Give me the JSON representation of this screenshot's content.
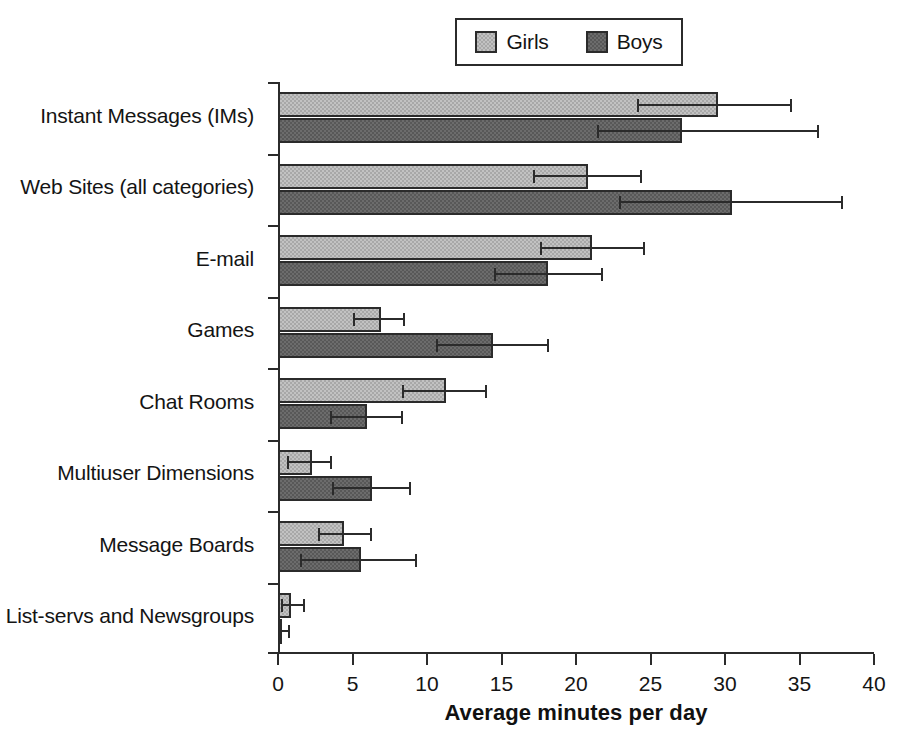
{
  "chart_data": {
    "type": "bar",
    "orientation": "horizontal",
    "title": "",
    "xlabel": "Average minutes per day",
    "ylabel": "",
    "xlim": [
      0,
      40
    ],
    "xticks": [
      0,
      5,
      10,
      15,
      20,
      25,
      30,
      35,
      40
    ],
    "grid": false,
    "legend_position": "top",
    "categories": [
      "Instant Messages (IMs)",
      "Web Sites (all categories)",
      "E-mail",
      "Games",
      "Chat Rooms",
      "Multiuser Dimensions",
      "Message Boards",
      "List-servs and Newsgroups"
    ],
    "series": [
      {
        "name": "Girls",
        "color": "#a8a8a8",
        "values": [
          29.5,
          20.8,
          21.1,
          6.9,
          11.3,
          2.3,
          4.4,
          0.9
        ],
        "err_low": [
          24.1,
          17.1,
          17.6,
          5.0,
          8.3,
          0.6,
          2.7,
          0.2
        ],
        "err_high": [
          34.5,
          24.4,
          24.6,
          8.5,
          14.0,
          3.6,
          6.3,
          1.8
        ]
      },
      {
        "name": "Boys",
        "color": "#585858",
        "values": [
          27.1,
          30.5,
          18.1,
          14.4,
          6.0,
          6.3,
          5.6,
          0.2
        ],
        "err_low": [
          21.4,
          22.9,
          14.5,
          10.6,
          3.5,
          3.6,
          1.5,
          0.1
        ],
        "err_high": [
          36.3,
          37.9,
          21.8,
          18.2,
          8.4,
          8.9,
          9.3,
          0.8
        ]
      }
    ]
  },
  "legend": {
    "entries": [
      {
        "label": "Girls",
        "color": "#a8a8a8"
      },
      {
        "label": "Boys",
        "color": "#585858"
      }
    ]
  },
  "axis": {
    "x_title": "Average minutes per day",
    "x_tick_labels": [
      "0",
      "5",
      "10",
      "15",
      "20",
      "25",
      "30",
      "35",
      "40"
    ]
  }
}
